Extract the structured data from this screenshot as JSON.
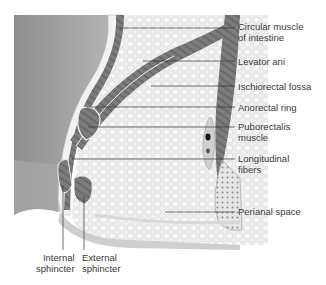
{
  "diagram": {
    "colors": {
      "lumen": "#9a9a9a",
      "mucosa": "#eeeeee",
      "muscle": "#7a7a7a",
      "muscle_dark": "#5e5e5e",
      "fat": "#ececec",
      "fat_cell_stroke": "#cfcfcf",
      "leader_line": "#333333",
      "text": "#3a3a3a"
    },
    "labels_right": [
      {
        "id": "circular-muscle",
        "lines": [
          "Circular muscle",
          "of intestine"
        ]
      },
      {
        "id": "levator-ani",
        "lines": [
          "Levator ani"
        ]
      },
      {
        "id": "ischiorectal-fossa",
        "lines": [
          "Ischiorectal fossa"
        ]
      },
      {
        "id": "anorectal-ring",
        "lines": [
          "Anorectal ring"
        ]
      },
      {
        "id": "puborectalis-muscle",
        "lines": [
          "Puborectalis",
          "muscle"
        ]
      },
      {
        "id": "longitudinal-fibers",
        "lines": [
          "Longitudinal",
          "fibers"
        ]
      },
      {
        "id": "perianal-space",
        "lines": [
          "Perianal space"
        ]
      }
    ],
    "labels_bottom": [
      {
        "id": "internal-sphincter",
        "lines": [
          "Internal",
          "sphincter"
        ]
      },
      {
        "id": "external-sphincter",
        "lines": [
          "External",
          "sphincter"
        ]
      }
    ]
  }
}
